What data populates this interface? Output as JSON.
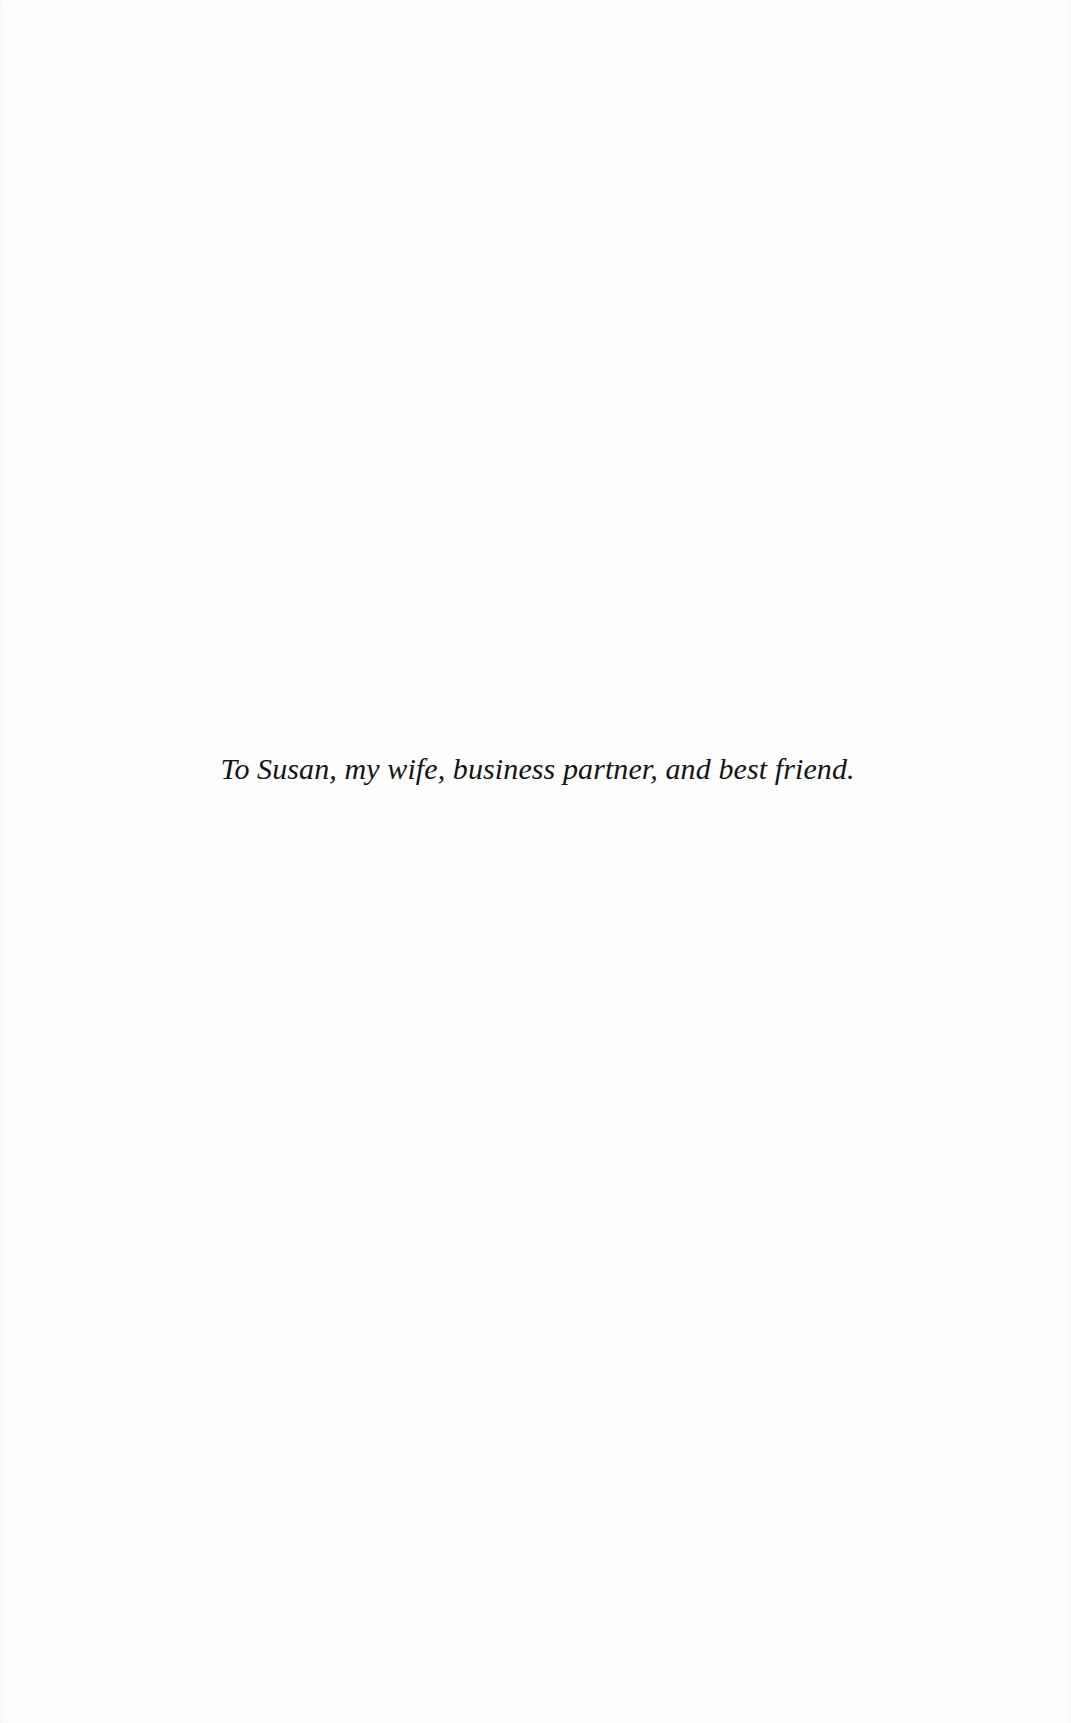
{
  "page": {
    "type": "dedication",
    "background_color": "#ffffff",
    "text_color": "#141414"
  },
  "dedication": {
    "text": "To Susan, my wife, business partner, and best friend."
  }
}
